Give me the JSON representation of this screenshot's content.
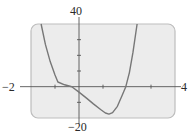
{
  "chart_data": {
    "type": "line",
    "title": "",
    "xlabel": "",
    "ylabel": "",
    "xlim": [
      -2,
      4
    ],
    "ylim": [
      -20,
      40
    ],
    "x_ticks": [
      -1,
      1,
      3
    ],
    "y_ticks": [
      -10,
      10,
      20,
      30
    ],
    "grid": false,
    "legend": null,
    "window_labels": {
      "xmin": "−2",
      "xmax": "4",
      "ymin": "−20",
      "ymax": "40"
    },
    "series": [
      {
        "name": "curve",
        "x": [
          -1.58,
          -1.4,
          -1.2,
          -1.0,
          -0.88,
          -0.6,
          -0.3,
          0.0,
          0.3,
          0.6,
          0.9,
          1.1,
          1.25,
          1.4,
          1.6,
          1.8,
          1.95,
          2.1,
          2.25,
          2.42
        ],
        "y": [
          40,
          27,
          16,
          7.5,
          3,
          1.2,
          0,
          -3.5,
          -7.2,
          -11,
          -14.6,
          -16.8,
          -17.5,
          -16.6,
          -12.5,
          -5.5,
          0,
          9,
          22,
          40
        ]
      }
    ]
  },
  "colors": {
    "frame_fill": "#ececec",
    "frame_border": "#bdbdbd",
    "axis": "#555555",
    "curve": "#777777"
  }
}
